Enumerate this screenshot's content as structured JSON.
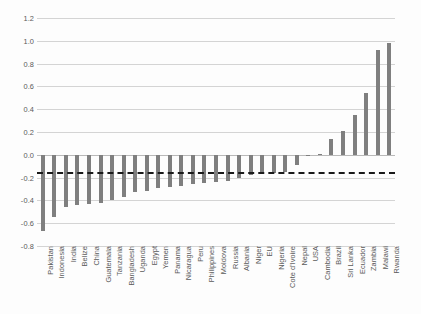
{
  "chart_data": {
    "type": "bar",
    "title": "",
    "subtitle": "",
    "xlabel": "",
    "ylabel": "",
    "ylim": [
      -0.8,
      1.2
    ],
    "yticks": [
      "1.2",
      "1.0",
      "0.8",
      "0.6",
      "0.4",
      "0.2",
      "0.0",
      "-0.2",
      "-0.4",
      "-0.6",
      "-0.8"
    ],
    "ytick_values": [
      1.2,
      1.0,
      0.8,
      0.6,
      0.4,
      0.2,
      0.0,
      -0.2,
      -0.4,
      -0.6,
      -0.8
    ],
    "grid": true,
    "legend": "none",
    "orientation": "vertical",
    "bar_color": "#7f7f7f",
    "reference_line": {
      "value": -0.15,
      "style": "dashed",
      "color": "#1a1a1a",
      "label": ""
    },
    "categories": [
      "Pakistan",
      "Indonesia",
      "India",
      "Belize",
      "China",
      "Guatemala",
      "Tanzania",
      "Bangladesh",
      "Uganda",
      "Egypt",
      "Yemen",
      "Panama",
      "Nicaragua",
      "Peru",
      "Philippines",
      "Moldova",
      "Russia",
      "Albania",
      "Niger",
      "EU",
      "Nigeria",
      "Cote d'Ivoire",
      "Nepal",
      "USA",
      "Cambodia",
      "Brazil",
      "Sri Lanka",
      "Ecuador",
      "Zambia",
      "Malawi",
      "Rwanda"
    ],
    "values": [
      -0.67,
      -0.55,
      -0.46,
      -0.44,
      -0.43,
      -0.42,
      -0.4,
      -0.37,
      -0.33,
      -0.32,
      -0.29,
      -0.28,
      -0.27,
      -0.26,
      -0.25,
      -0.24,
      -0.23,
      -0.2,
      -0.18,
      -0.17,
      -0.16,
      -0.15,
      -0.09,
      -0.01,
      0.01,
      0.14,
      0.21,
      0.35,
      0.54,
      0.92,
      0.98
    ]
  }
}
